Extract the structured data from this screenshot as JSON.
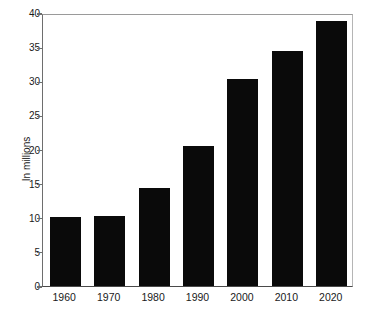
{
  "chart_data": {
    "type": "bar",
    "title": "",
    "subtitle": "",
    "xlabel": "",
    "ylabel": "In millions",
    "categories": [
      "1960",
      "1970",
      "1980",
      "1990",
      "2000",
      "2010",
      "2020"
    ],
    "values": [
      10.1,
      10.2,
      14.3,
      20.5,
      30.4,
      34.4,
      38.9
    ],
    "series": [
      {
        "name": "Population",
        "values": [
          10.1,
          10.2,
          14.3,
          20.5,
          30.4,
          34.4,
          38.9
        ]
      }
    ],
    "ylim": [
      0,
      40
    ],
    "yticks": [
      0,
      5,
      10,
      15,
      20,
      25,
      30,
      35,
      40
    ],
    "ytick_labels": [
      "0",
      "5",
      "10",
      "15",
      "20",
      "25",
      "30",
      "35",
      "40"
    ],
    "xtick_labels": [
      "1960",
      "1970",
      "1980",
      "1990",
      "2000",
      "2010",
      "2020"
    ],
    "grid": false,
    "legend": false,
    "legend_position": "none",
    "bar_color": "#0a0a0a",
    "background_color": "#ffffff",
    "axis_color": "#4a4a4a",
    "annotations": []
  },
  "axis": {
    "y_title": "In millions",
    "y_labels": [
      "40",
      "35",
      "30",
      "25",
      "20",
      "15",
      "10",
      "5",
      "0"
    ],
    "x_labels": [
      "1960",
      "1970",
      "1980",
      "1990",
      "2000",
      "2010",
      "2020"
    ]
  }
}
